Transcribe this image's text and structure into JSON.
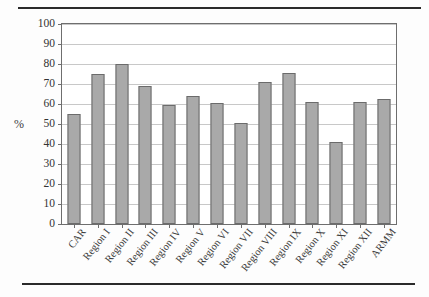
{
  "figure": {
    "axis_label_y": "%",
    "bar_color": "#a9a9a9",
    "bar_border_color": "#6b6b6b",
    "gridline_color": "#c8c8c8",
    "frame_color": "#6e6e6e"
  },
  "chart_data": {
    "type": "bar",
    "title": "",
    "xlabel": "",
    "ylabel": "%",
    "ylim": [
      0,
      100
    ],
    "yticks": [
      0,
      10,
      20,
      30,
      40,
      50,
      60,
      70,
      80,
      90,
      100
    ],
    "grid": true,
    "legend": null,
    "categories": [
      "CAR",
      "Region I",
      "Region II",
      "Region III",
      "Region IV",
      "Region V",
      "Region VI",
      "Region VII",
      "Region VIII",
      "Region IX",
      "Region X",
      "Region XI",
      "Region XII",
      "ARMM"
    ],
    "values": [
      55,
      75,
      80,
      69,
      59.5,
      64,
      60.5,
      50.5,
      71,
      75.5,
      61,
      41,
      61,
      62.5
    ]
  }
}
